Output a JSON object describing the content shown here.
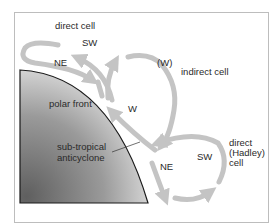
{
  "labels": {
    "direct_cell_top": "direct cell",
    "sw_top": "SW",
    "ne_top": "NE",
    "w_paren": "(W)",
    "indirect_cell": "indirect cell",
    "polar_front": "polar front",
    "w_mid": "W",
    "subtropical_line1": "sub-tropical",
    "subtropical_line2": "anticyclone",
    "ne_bottom": "NE",
    "sw_bottom": "SW",
    "hadley_line1": "direct",
    "hadley_line2": "(Hadley)",
    "hadley_line3": "cell"
  },
  "colors": {
    "arrow": "#c4c4c4",
    "polar_dark": "#6e6e6e",
    "polar_light": "#e6e6e6",
    "frame": "#bdbdbd"
  }
}
